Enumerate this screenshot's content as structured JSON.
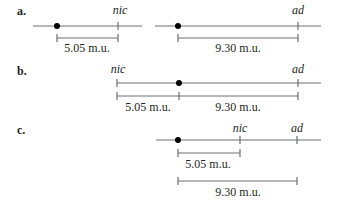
{
  "figure": {
    "panels": [
      {
        "label": "a.",
        "markers": [
          {
            "text": "nic"
          },
          {
            "text": "ad"
          }
        ],
        "distances": [
          {
            "text": "5.05 m.u."
          },
          {
            "text": "9.30 m.u."
          }
        ]
      },
      {
        "label": "b.",
        "markers": [
          {
            "text": "nic"
          },
          {
            "text": "ad"
          }
        ],
        "distances": [
          {
            "text": "5.05 m.u."
          },
          {
            "text": "9.30 m.u."
          }
        ]
      },
      {
        "label": "c.",
        "markers": [
          {
            "text": "nic"
          },
          {
            "text": "ad"
          }
        ],
        "distances": [
          {
            "text": "5.05 m.u."
          },
          {
            "text": "9.30 m.u."
          }
        ]
      }
    ],
    "colors": {
      "line": "#6d6e71",
      "ink": "#231f20",
      "dot": "#000000"
    }
  }
}
